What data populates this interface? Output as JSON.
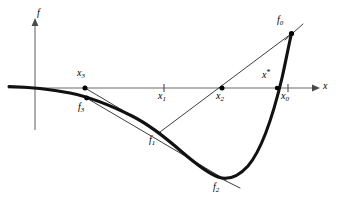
{
  "figure": {
    "type": "math-diagram",
    "background_color": "#ffffff",
    "width": 339,
    "height": 209
  },
  "axes": {
    "vertical_label": "f",
    "horizontal_label": "x",
    "vertical_axis": {
      "x": 35,
      "y_top": 20,
      "y_bottom": 130
    },
    "horizontal_axis": {
      "y": 88,
      "x_left": 8,
      "x_right": 316
    },
    "axis_color": "#6b6b6b"
  },
  "curve": {
    "name": "function-curve",
    "color": "#111111",
    "stroke_width": 3.1,
    "path": "M 9,86.5 C 30,87 52,89.5 70,93 C 92,97.5 112,106 132,116 C 150,125 166,138 182,152 C 196,164 208,173 218,177 C 228,180.5 238,177 248,166 C 260,152 272,120 282,78 C 286,60 289,44 291.5,33.5"
  },
  "secant_lines": [
    {
      "name": "secant-f0-to-x2-f1",
      "from": [
        291.5,
        33.5
      ],
      "to": [
        160,
        132
      ],
      "stroke_width": 0.85,
      "passes_through": "x2"
    },
    {
      "name": "secant-x3-to-f1",
      "from": [
        85,
        88
      ],
      "to": [
        161,
        133
      ],
      "stroke_width": 0.9
    },
    {
      "name": "secant-f3-to-f2",
      "from": [
        86.5,
        98
      ],
      "to": [
        226,
        180
      ],
      "stroke_width": 0.9
    },
    {
      "name": "tangent-mark-f0",
      "from": [
        286,
        39
      ],
      "to": [
        302,
        25
      ],
      "stroke_width": 0.85
    },
    {
      "name": "tangent-mark-f2",
      "from": [
        214,
        175
      ],
      "to": [
        239,
        188
      ],
      "stroke_width": 0.85
    }
  ],
  "points": [
    {
      "id": "f0",
      "label": "f",
      "subscript": "0",
      "superscript": "",
      "marker": "dot",
      "marker_x": 291.5,
      "marker_y": 33.5,
      "label_x": 277,
      "label_y": 16,
      "on_axis": false
    },
    {
      "id": "x0",
      "label": "x",
      "subscript": "0",
      "superscript": "",
      "marker": "tick",
      "marker_x": 288,
      "marker_y": 88,
      "label_x": 282,
      "label_y": 92,
      "on_axis": true
    },
    {
      "id": "xstar",
      "label": "x",
      "subscript": "",
      "superscript": "*",
      "marker": "none",
      "marker_x": 277,
      "marker_y": 88,
      "label_x": 262,
      "label_y": 72,
      "on_axis": true
    },
    {
      "id": "x1",
      "label": "x",
      "subscript": "1",
      "superscript": "",
      "marker": "tick",
      "marker_x": 164,
      "marker_y": 88,
      "label_x": 159,
      "label_y": 92,
      "on_axis": true
    },
    {
      "id": "x2",
      "label": "x",
      "subscript": "2",
      "superscript": "",
      "marker": "dot",
      "marker_x": 222,
      "marker_y": 88,
      "label_x": 216,
      "label_y": 92,
      "on_axis": true
    },
    {
      "id": "x3",
      "label": "x",
      "subscript": "3",
      "superscript": "",
      "marker": "dot",
      "marker_x": 85,
      "marker_y": 88,
      "label_x": 78,
      "label_y": 69,
      "on_axis": true
    },
    {
      "id": "f1",
      "label": "f",
      "subscript": "1",
      "superscript": "",
      "marker": "none",
      "marker_x": 160,
      "marker_y": 132,
      "label_x": 150,
      "label_y": 136,
      "on_axis": false
    },
    {
      "id": "f2",
      "label": "f",
      "subscript": "2",
      "superscript": "",
      "marker": "none",
      "marker_x": 221,
      "marker_y": 178,
      "label_x": 214,
      "label_y": 183,
      "on_axis": false
    },
    {
      "id": "f3",
      "label": "f",
      "subscript": "3",
      "superscript": "",
      "marker": "dot",
      "marker_x": 86.5,
      "marker_y": 98,
      "label_x": 79,
      "label_y": 103,
      "on_axis": false
    }
  ]
}
